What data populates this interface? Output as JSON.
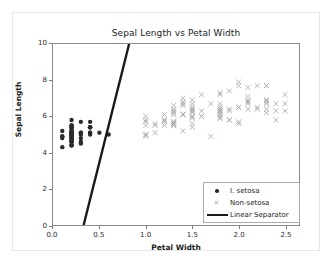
{
  "chart_data": {
    "type": "scatter",
    "title": "Sepal Length vs Petal Width",
    "xlabel": "Petal Width",
    "ylabel": "Sepal Length",
    "xlim": [
      0.0,
      2.65
    ],
    "ylim": [
      0,
      10
    ],
    "xticks": [
      "0.0",
      "0.5",
      "1.0",
      "1.5",
      "2.0",
      "2.5"
    ],
    "xtick_values": [
      0.0,
      0.5,
      1.0,
      1.5,
      2.0,
      2.5
    ],
    "yticks": [
      "0",
      "2",
      "4",
      "6",
      "8",
      "10"
    ],
    "ytick_values": [
      0,
      2,
      4,
      6,
      8,
      10
    ],
    "grid": false,
    "legend_position": "lower right",
    "series": [
      {
        "name": "I. setosa",
        "marker": "circle",
        "color": "#2b2b2b",
        "points": [
          [
            0.2,
            5.1
          ],
          [
            0.2,
            4.9
          ],
          [
            0.2,
            4.7
          ],
          [
            0.2,
            4.6
          ],
          [
            0.2,
            5.0
          ],
          [
            0.4,
            5.4
          ],
          [
            0.3,
            4.6
          ],
          [
            0.2,
            5.0
          ],
          [
            0.2,
            4.4
          ],
          [
            0.1,
            4.9
          ],
          [
            0.2,
            5.4
          ],
          [
            0.2,
            4.8
          ],
          [
            0.1,
            4.8
          ],
          [
            0.1,
            4.3
          ],
          [
            0.2,
            5.8
          ],
          [
            0.4,
            5.7
          ],
          [
            0.4,
            5.4
          ],
          [
            0.3,
            5.1
          ],
          [
            0.3,
            5.7
          ],
          [
            0.3,
            5.1
          ],
          [
            0.2,
            5.4
          ],
          [
            0.4,
            5.1
          ],
          [
            0.2,
            4.6
          ],
          [
            0.5,
            5.1
          ],
          [
            0.2,
            4.8
          ],
          [
            0.2,
            5.0
          ],
          [
            0.4,
            5.0
          ],
          [
            0.2,
            5.2
          ],
          [
            0.2,
            5.2
          ],
          [
            0.2,
            4.7
          ],
          [
            0.2,
            4.8
          ],
          [
            0.4,
            5.4
          ],
          [
            0.1,
            5.2
          ],
          [
            0.2,
            5.5
          ],
          [
            0.2,
            4.9
          ],
          [
            0.2,
            5.0
          ],
          [
            0.2,
            5.5
          ],
          [
            0.1,
            4.9
          ],
          [
            0.2,
            4.4
          ],
          [
            0.2,
            5.1
          ],
          [
            0.3,
            5.0
          ],
          [
            0.3,
            4.5
          ],
          [
            0.2,
            4.4
          ],
          [
            0.6,
            5.0
          ],
          [
            0.4,
            5.1
          ],
          [
            0.3,
            4.8
          ],
          [
            0.2,
            5.1
          ],
          [
            0.2,
            4.6
          ],
          [
            0.2,
            5.3
          ],
          [
            0.2,
            5.0
          ]
        ]
      },
      {
        "name": "Non-setosa",
        "marker": "x",
        "color": "#a9adb1",
        "points": [
          [
            1.4,
            7.0
          ],
          [
            1.5,
            6.4
          ],
          [
            1.5,
            6.9
          ],
          [
            1.3,
            5.5
          ],
          [
            1.5,
            6.5
          ],
          [
            1.3,
            5.7
          ],
          [
            1.6,
            6.3
          ],
          [
            1.0,
            4.9
          ],
          [
            1.3,
            6.6
          ],
          [
            1.4,
            5.2
          ],
          [
            1.0,
            5.0
          ],
          [
            1.5,
            5.9
          ],
          [
            1.0,
            6.0
          ],
          [
            1.4,
            6.1
          ],
          [
            1.3,
            5.6
          ],
          [
            1.4,
            6.7
          ],
          [
            1.5,
            5.6
          ],
          [
            1.0,
            5.8
          ],
          [
            1.5,
            6.2
          ],
          [
            1.1,
            5.6
          ],
          [
            1.8,
            5.9
          ],
          [
            1.3,
            6.1
          ],
          [
            1.5,
            6.3
          ],
          [
            1.2,
            6.1
          ],
          [
            1.3,
            6.4
          ],
          [
            1.4,
            6.6
          ],
          [
            1.4,
            6.8
          ],
          [
            1.7,
            6.7
          ],
          [
            1.5,
            6.0
          ],
          [
            1.0,
            5.7
          ],
          [
            1.1,
            5.5
          ],
          [
            1.0,
            5.5
          ],
          [
            1.2,
            5.8
          ],
          [
            1.6,
            6.0
          ],
          [
            1.5,
            5.4
          ],
          [
            1.6,
            6.0
          ],
          [
            1.5,
            6.7
          ],
          [
            1.3,
            6.3
          ],
          [
            1.3,
            5.6
          ],
          [
            1.3,
            5.5
          ],
          [
            1.2,
            5.5
          ],
          [
            1.4,
            6.1
          ],
          [
            1.2,
            5.8
          ],
          [
            1.0,
            5.0
          ],
          [
            1.3,
            5.6
          ],
          [
            1.2,
            5.7
          ],
          [
            1.3,
            5.7
          ],
          [
            1.3,
            6.2
          ],
          [
            1.1,
            5.1
          ],
          [
            1.3,
            5.7
          ],
          [
            2.5,
            6.3
          ],
          [
            1.9,
            5.8
          ],
          [
            2.1,
            7.1
          ],
          [
            1.8,
            6.3
          ],
          [
            2.2,
            6.5
          ],
          [
            2.1,
            7.6
          ],
          [
            1.7,
            4.9
          ],
          [
            1.8,
            7.3
          ],
          [
            1.8,
            6.7
          ],
          [
            2.5,
            7.2
          ],
          [
            2.0,
            6.5
          ],
          [
            1.9,
            6.4
          ],
          [
            2.1,
            6.8
          ],
          [
            2.0,
            5.7
          ],
          [
            2.4,
            5.8
          ],
          [
            2.3,
            6.4
          ],
          [
            1.8,
            6.5
          ],
          [
            2.2,
            7.7
          ],
          [
            2.3,
            7.7
          ],
          [
            1.5,
            6.0
          ],
          [
            2.3,
            6.9
          ],
          [
            2.0,
            5.6
          ],
          [
            2.0,
            7.7
          ],
          [
            1.8,
            6.3
          ],
          [
            2.1,
            6.7
          ],
          [
            1.8,
            7.2
          ],
          [
            1.8,
            6.2
          ],
          [
            1.8,
            6.1
          ],
          [
            2.1,
            6.4
          ],
          [
            1.6,
            7.2
          ],
          [
            1.9,
            7.4
          ],
          [
            2.0,
            7.9
          ],
          [
            2.2,
            6.4
          ],
          [
            1.5,
            6.3
          ],
          [
            1.4,
            6.1
          ],
          [
            2.3,
            7.7
          ],
          [
            2.4,
            6.3
          ],
          [
            1.8,
            6.4
          ],
          [
            1.8,
            6.0
          ],
          [
            2.1,
            6.9
          ],
          [
            2.4,
            6.7
          ],
          [
            2.3,
            6.9
          ],
          [
            1.9,
            5.8
          ],
          [
            2.3,
            6.8
          ],
          [
            2.5,
            6.7
          ],
          [
            2.3,
            6.7
          ],
          [
            1.9,
            6.3
          ],
          [
            2.0,
            6.5
          ],
          [
            2.3,
            6.2
          ],
          [
            1.8,
            5.9
          ]
        ]
      }
    ],
    "separator": {
      "name": "Linear Separator",
      "color": "#1a1a1a",
      "linewidth": 2.4,
      "x0": 0.33,
      "y0": 0.0,
      "x1": 0.82,
      "y1": 10.0
    }
  },
  "legend": {
    "items": [
      {
        "label": "I. setosa",
        "handle": "circle-marker"
      },
      {
        "label": "Non-setosa",
        "handle": "x-marker"
      },
      {
        "label": "Linear Separator",
        "handle": "line-swatch"
      }
    ]
  }
}
